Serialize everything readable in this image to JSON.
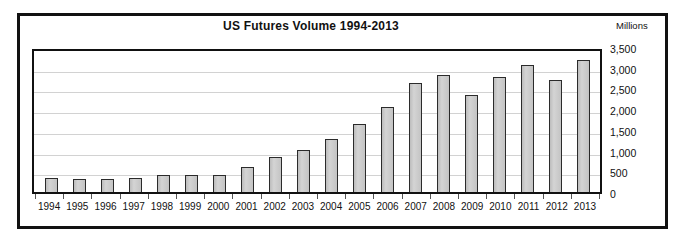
{
  "chart_data": {
    "type": "bar",
    "title": "US Futures Volume 1994-2013",
    "xlabel": "",
    "ylabel": "Millions",
    "axis_units_label": "Millions",
    "ylim": [
      0,
      3500
    ],
    "ytick_step": 500,
    "ytick_labels": [
      "3,500",
      "3,000",
      "2,500",
      "2,000",
      "1,500",
      "1,000",
      "500",
      "0"
    ],
    "ytick_values": [
      3500,
      3000,
      2500,
      2000,
      1500,
      1000,
      500,
      0
    ],
    "grid": true,
    "legend": "none",
    "bar_fill_color": "#c6c6c6",
    "bar_border_color": "#2b2b2b",
    "categories": [
      "1994",
      "1995",
      "1996",
      "1997",
      "1998",
      "1999",
      "2000",
      "2001",
      "2002",
      "2003",
      "2004",
      "2005",
      "2006",
      "2007",
      "2008",
      "2009",
      "2010",
      "2011",
      "2012",
      "2013"
    ],
    "values": [
      350,
      320,
      320,
      350,
      420,
      410,
      410,
      600,
      850,
      1020,
      1290,
      1630,
      2050,
      2640,
      2830,
      2340,
      2780,
      3060,
      2700,
      3180
    ],
    "series": [
      {
        "name": "US Futures Volume",
        "values": [
          350,
          320,
          320,
          350,
          420,
          410,
          410,
          600,
          850,
          1020,
          1290,
          1630,
          2050,
          2640,
          2830,
          2340,
          2780,
          3060,
          2700,
          3180
        ]
      }
    ]
  }
}
